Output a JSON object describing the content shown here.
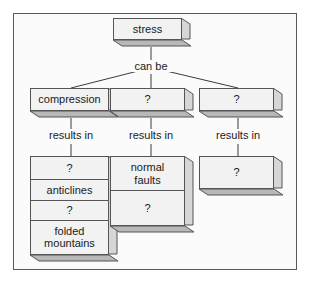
{
  "diagram": {
    "type": "concept-map",
    "title_node": {
      "label": "stress"
    },
    "connectors": {
      "can_be": "can be",
      "results_in_left": "results in",
      "results_in_middle": "results in",
      "results_in_right": "results in"
    },
    "branches": [
      {
        "id": "left",
        "label": "compression"
      },
      {
        "id": "middle",
        "label": "?"
      },
      {
        "id": "right",
        "label": "?"
      }
    ],
    "outcomes": {
      "left": {
        "rows": [
          "?",
          "anticlines",
          "?",
          "folded\nmountains"
        ]
      },
      "middle": {
        "rows": [
          "normal\nfaults",
          "?"
        ]
      },
      "right": {
        "rows": [
          "?"
        ]
      }
    },
    "colors": {
      "frame_border": "#595959",
      "page_background": "#ffffff",
      "canvas_background": "#fbfbfb",
      "box_fill": "#f2f2f2",
      "box_border": "#555555",
      "box_shadow_fill": "#b8b8b8",
      "text": "#1a1a1a",
      "line": "#3a3a3a"
    }
  }
}
